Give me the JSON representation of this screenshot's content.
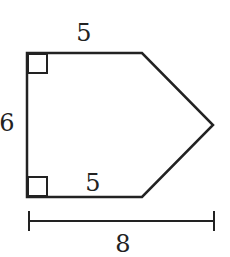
{
  "figure": {
    "shape": "pentagon",
    "stroke_color": "#222222",
    "background": "#ffffff",
    "labels": {
      "top_side": "5",
      "left_side": "6",
      "bottom_side": "5",
      "total_width": "8"
    },
    "right_angle_markers": [
      "top-left",
      "bottom-left"
    ]
  }
}
